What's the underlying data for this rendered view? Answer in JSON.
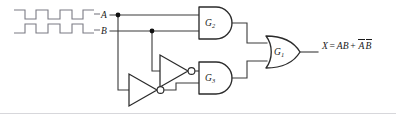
{
  "diagram": {
    "signals": {
      "input_a_label": "A",
      "input_b_label": "B",
      "output_expression_text": "X = AB + AB"
    },
    "output": {
      "variable": "X",
      "equals": "=",
      "term1": "AB",
      "plus": "+",
      "term2_overbar_a": "A",
      "term2_overbar_b": "B"
    },
    "gates": [
      {
        "id": "G1",
        "name": "G",
        "subscript": "1",
        "type": "OR"
      },
      {
        "id": "G2",
        "name": "G",
        "subscript": "2",
        "type": "AND"
      },
      {
        "id": "G3",
        "name": "G",
        "subscript": "3",
        "type": "AND"
      }
    ],
    "inverters": [
      {
        "id": "INV_B",
        "input": "B",
        "output": "B-not"
      },
      {
        "id": "INV_A",
        "input": "A",
        "output": "A-not"
      }
    ],
    "junctions": [
      {
        "id": "node-a",
        "signal": "A"
      },
      {
        "id": "node-b",
        "signal": "B"
      }
    ],
    "waveforms": {
      "a": {
        "label": "A",
        "levels": [
          1,
          0,
          1,
          0,
          1,
          0,
          1
        ],
        "description": "square wave, starts high"
      },
      "b": {
        "label": "B",
        "levels": [
          0,
          1,
          0,
          1,
          0,
          1,
          0
        ],
        "description": "square wave, starts low"
      }
    },
    "colors": {
      "wire": "#3a3a3a",
      "gate_stroke": "#2b2b2b",
      "waveform": "#7b7b84",
      "text": "#1a1a1a",
      "background": "#ffffff",
      "frame": "#d7d7db"
    }
  }
}
